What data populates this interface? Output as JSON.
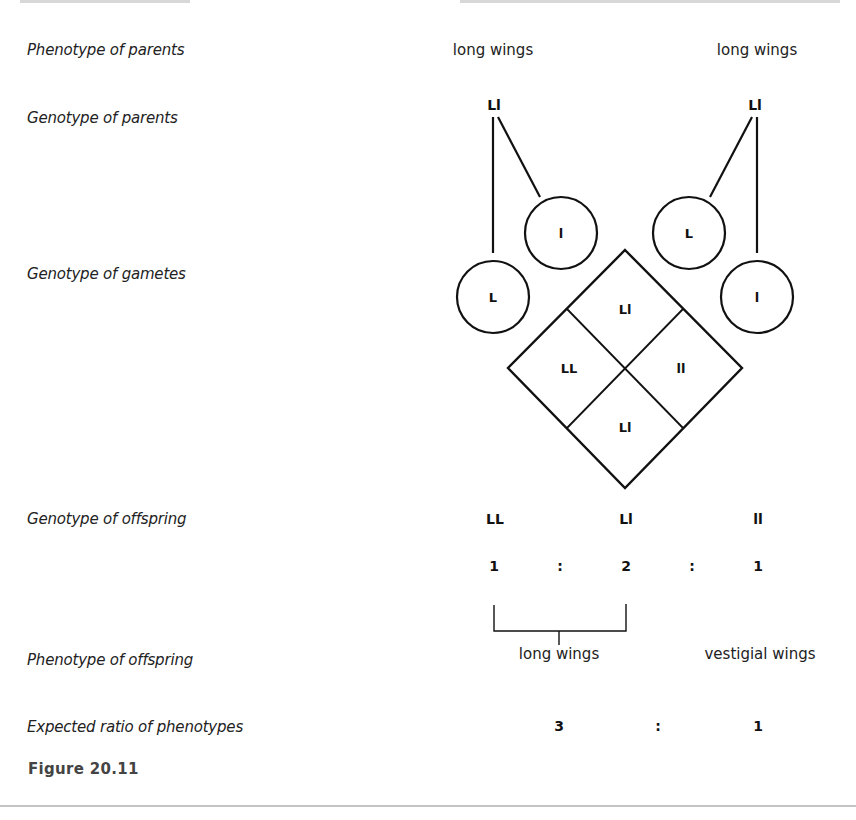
{
  "figure": {
    "label": "Figure 20.11",
    "rows": {
      "phenotype_parents": "Phenotype of parents",
      "genotype_parents": "Genotype of parents",
      "genotype_gametes": "Genotype of gametes",
      "genotype_offspring": "Genotype of offspring",
      "phenotype_offspring": "Phenotype of offspring",
      "expected_ratio": "Expected ratio of phenotypes"
    },
    "parents": [
      {
        "phenotype": "long wings",
        "genotype": "Ll",
        "gametes": [
          "L",
          "l"
        ]
      },
      {
        "phenotype": "long wings",
        "genotype": "Ll",
        "gametes": [
          "L",
          "l"
        ]
      }
    ],
    "punnett": {
      "top": "Ll",
      "left": "LL",
      "right": "ll",
      "bottom": "Ll"
    },
    "offspring_genotypes": [
      "LL",
      "Ll",
      "ll"
    ],
    "genotype_ratio": [
      "1",
      ":",
      "2",
      ":",
      "1"
    ],
    "offspring_phenotypes": [
      "long wings",
      "vestigial wings"
    ],
    "phenotype_ratio": [
      "3",
      ":",
      "1"
    ]
  }
}
